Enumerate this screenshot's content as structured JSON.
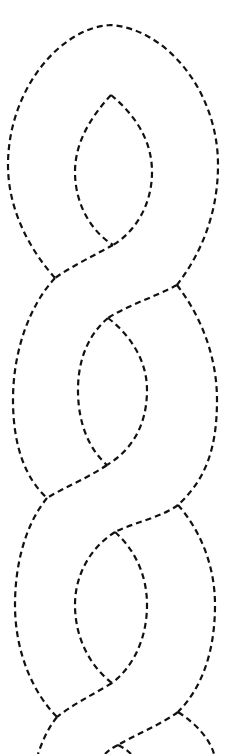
{
  "figure": {
    "type": "dashed-line braid pattern",
    "stroke_color": "#111111",
    "background_color": "#ffffff",
    "loops_visible": 3,
    "caption": ""
  }
}
